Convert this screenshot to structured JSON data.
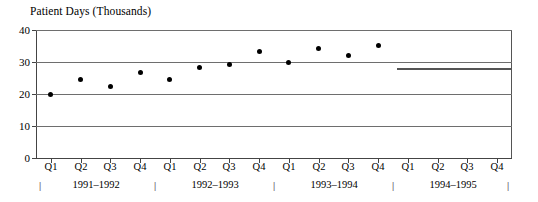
{
  "chart_data": {
    "type": "scatter",
    "title": "Patient Days (Thousands)",
    "xlabel": "",
    "ylabel": "Patient Days (Thousands)",
    "ylim": [
      0,
      40
    ],
    "yticks": [
      0,
      10,
      20,
      30,
      40
    ],
    "ytick_labels": [
      "0",
      "10",
      "20",
      "30",
      "40"
    ],
    "grid": true,
    "grid_axis": "y",
    "legend": "none",
    "categories": [
      "Q1",
      "Q2",
      "Q3",
      "Q4",
      "Q1",
      "Q2",
      "Q3",
      "Q4",
      "Q1",
      "Q2",
      "Q3",
      "Q4",
      "Q1",
      "Q2",
      "Q3",
      "Q4"
    ],
    "values": [
      20.0,
      24.5,
      22.2,
      26.8,
      24.5,
      28.2,
      29.2,
      33.2,
      30.0,
      34.2,
      32.0,
      35.2,
      null,
      null,
      null,
      null
    ],
    "year_groups": [
      {
        "label": "1991–1992",
        "quarters": [
          "Q1",
          "Q2",
          "Q3",
          "Q4"
        ]
      },
      {
        "label": "1992–1993",
        "quarters": [
          "Q1",
          "Q2",
          "Q3",
          "Q4"
        ]
      },
      {
        "label": "1993–1994",
        "quarters": [
          "Q1",
          "Q2",
          "Q3",
          "Q4"
        ]
      },
      {
        "label": "1994–1995",
        "quarters": [
          "Q1",
          "Q2",
          "Q3",
          "Q4"
        ]
      }
    ],
    "year_separator_glyph": "|",
    "annotations": [
      {
        "type": "horizontal-line",
        "value": 28,
        "x_start": "Q1 1994–1995",
        "x_end": "Q4 1994–1995",
        "color": "#555555"
      }
    ],
    "colors": {
      "marker": "#000000",
      "gridline": "#6e6e6e",
      "axis": "#444444",
      "frame": "#555555",
      "annotation_line": "#555555",
      "background": "#ffffff",
      "text": "#000000"
    }
  }
}
